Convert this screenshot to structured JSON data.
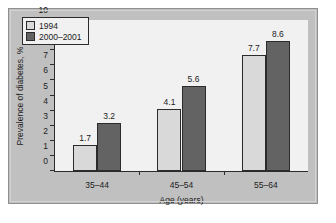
{
  "chart_data": {
    "type": "bar",
    "title": "",
    "categories": [
      "35–44",
      "45–54",
      "55–64"
    ],
    "series": [
      {
        "name": "1994",
        "values": [
          1.7,
          4.1,
          7.7
        ],
        "color": "#d9d9d9"
      },
      {
        "name": "2000–2001",
        "values": [
          3.2,
          5.6,
          8.6
        ],
        "color": "#636363"
      }
    ],
    "xlabel": "Age (years)",
    "ylabel": "Prevalence of diabetes, %",
    "ylim": [
      0,
      10
    ],
    "yticks": [
      0,
      1,
      2,
      3,
      4,
      5,
      6,
      7,
      8,
      9,
      10
    ],
    "ytick_labels": [
      "0",
      "1",
      "2",
      "3",
      "4",
      "5",
      "6",
      "7",
      "8",
      "9",
      "10"
    ],
    "grid": false,
    "legend_position": "top-left",
    "data_labels": [
      "1.7",
      "3.2",
      "4.1",
      "5.6",
      "7.7",
      "8.6"
    ],
    "colors": {
      "figure_background": "#c0c0c0",
      "plot_background": "#f1f1f1",
      "axis": "#2b2b2b",
      "series_1994": "#d9d9d9",
      "series_2000_2001": "#636363"
    }
  }
}
